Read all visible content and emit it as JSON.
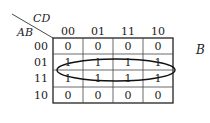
{
  "kmap": {
    "var_cols": "CD",
    "var_rows": "AB",
    "col_headers": [
      "00",
      "01",
      "11",
      "10"
    ],
    "row_headers": [
      "00",
      "01",
      "11",
      "10"
    ],
    "cells": [
      [
        "0",
        "0",
        "0",
        "0"
      ],
      [
        "1",
        "1",
        "1",
        "1"
      ],
      [
        "1",
        "1",
        "1",
        "1"
      ],
      [
        "0",
        "0",
        "0",
        "0"
      ]
    ],
    "group_label": "B",
    "grouping": {
      "shape": "ellipse",
      "covers_rows": [
        "01",
        "11"
      ],
      "covers_cols": [
        "00",
        "01",
        "11",
        "10"
      ]
    }
  }
}
